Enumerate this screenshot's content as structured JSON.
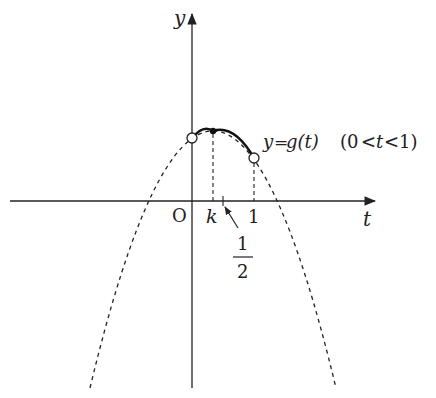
{
  "diagram": {
    "type": "function-graph",
    "axes": {
      "x_label": "t",
      "y_label": "y",
      "origin_label": "O"
    },
    "ticks": {
      "k_label": "k",
      "one_label": "1",
      "half_numerator": "1",
      "half_denominator": "2"
    },
    "curve_label": {
      "lhs": "y",
      "eq": "=",
      "func": "g(t)",
      "domain_open": "(0",
      "lt1": "<",
      "var": "t",
      "lt2": "<",
      "domain_close": "1)"
    },
    "points": [
      {
        "name": "start",
        "t": 0,
        "style": "open"
      },
      {
        "name": "vertex",
        "t": "k",
        "style": "filled"
      },
      {
        "name": "end",
        "t": 1,
        "style": "open"
      }
    ],
    "colors": {
      "stroke": "#222222",
      "background": "#ffffff"
    }
  }
}
